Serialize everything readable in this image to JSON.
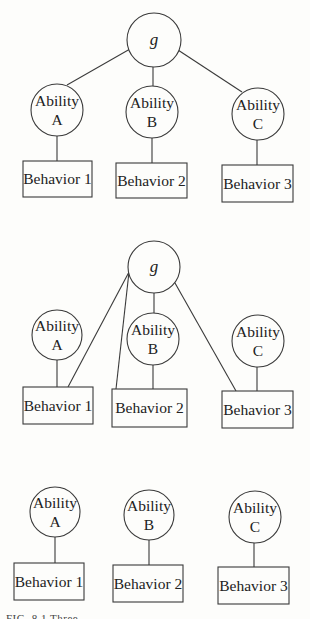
{
  "figure": {
    "caption": "FIG. 8.1   Three",
    "panels": [
      {
        "id": "panel-hierarchical",
        "nodes": [
          {
            "id": "g",
            "type": "circle",
            "label_lines": [
              "g"
            ],
            "italic": true,
            "cx": 154,
            "cy": 40,
            "r": 27
          },
          {
            "id": "ability-a",
            "type": "circle",
            "label_lines": [
              "Ability",
              "A"
            ],
            "cx": 57,
            "cy": 110,
            "r": 26
          },
          {
            "id": "ability-b",
            "type": "circle",
            "label_lines": [
              "Ability",
              "B"
            ],
            "cx": 152,
            "cy": 112,
            "r": 26
          },
          {
            "id": "ability-c",
            "type": "circle",
            "label_lines": [
              "Ability",
              "C"
            ],
            "cx": 258,
            "cy": 114,
            "r": 26
          },
          {
            "id": "behavior-1",
            "type": "box",
            "label_lines": [
              "Behavior 1"
            ],
            "x": 23,
            "y": 161,
            "w": 69,
            "h": 36
          },
          {
            "id": "behavior-2",
            "type": "box",
            "label_lines": [
              "Behavior 2"
            ],
            "x": 116,
            "y": 163,
            "w": 71,
            "h": 35
          },
          {
            "id": "behavior-3",
            "type": "box",
            "label_lines": [
              "Behavior 3"
            ],
            "x": 222,
            "y": 165,
            "w": 71,
            "h": 37
          }
        ],
        "edges": [
          {
            "x1": 130,
            "y1": 49,
            "x2": 67,
            "y2": 85
          },
          {
            "x1": 153,
            "y1": 67,
            "x2": 153,
            "y2": 86
          },
          {
            "x1": 178,
            "y1": 50,
            "x2": 242,
            "y2": 92
          },
          {
            "x1": 57,
            "y1": 136,
            "x2": 57,
            "y2": 161
          },
          {
            "x1": 152,
            "y1": 138,
            "x2": 152,
            "y2": 163
          },
          {
            "x1": 257,
            "y1": 140,
            "x2": 257,
            "y2": 165
          }
        ]
      },
      {
        "id": "panel-direct-g",
        "nodes": [
          {
            "id": "g",
            "type": "circle",
            "label_lines": [
              "g"
            ],
            "italic": true,
            "cx": 154,
            "cy": 267,
            "r": 26
          },
          {
            "id": "ability-a",
            "type": "circle",
            "label_lines": [
              "Ability",
              "A"
            ],
            "cx": 57,
            "cy": 335,
            "r": 25
          },
          {
            "id": "ability-b",
            "type": "circle",
            "label_lines": [
              "Ability",
              "B"
            ],
            "cx": 153,
            "cy": 339,
            "r": 26
          },
          {
            "id": "ability-c",
            "type": "circle",
            "label_lines": [
              "Ability",
              "C"
            ],
            "cx": 258,
            "cy": 341,
            "r": 26
          },
          {
            "id": "behavior-1",
            "type": "box",
            "label_lines": [
              "Behavior 1"
            ],
            "x": 23,
            "y": 387,
            "w": 70,
            "h": 37
          },
          {
            "id": "behavior-2",
            "type": "box",
            "label_lines": [
              "Behavior 2"
            ],
            "x": 112,
            "y": 389,
            "w": 75,
            "h": 38
          },
          {
            "id": "behavior-3",
            "type": "box",
            "label_lines": [
              "Behavior 3"
            ],
            "x": 222,
            "y": 391,
            "w": 71,
            "h": 37
          }
        ],
        "edges": [
          {
            "x1": 129,
            "y1": 272,
            "x2": 68,
            "y2": 387
          },
          {
            "x1": 129,
            "y1": 272,
            "x2": 116,
            "y2": 389
          },
          {
            "x1": 154,
            "y1": 293,
            "x2": 154,
            "y2": 313
          },
          {
            "x1": 175,
            "y1": 283,
            "x2": 236,
            "y2": 391
          },
          {
            "x1": 57,
            "y1": 360,
            "x2": 57,
            "y2": 387
          },
          {
            "x1": 153,
            "y1": 365,
            "x2": 153,
            "y2": 389
          },
          {
            "x1": 257,
            "y1": 367,
            "x2": 257,
            "y2": 391
          }
        ]
      },
      {
        "id": "panel-independent",
        "nodes": [
          {
            "id": "ability-a",
            "type": "circle",
            "label_lines": [
              "Ability",
              "A"
            ],
            "cx": 55,
            "cy": 512,
            "r": 25
          },
          {
            "id": "ability-b",
            "type": "circle",
            "label_lines": [
              "Ability",
              "B"
            ],
            "cx": 149,
            "cy": 515,
            "r": 25
          },
          {
            "id": "ability-c",
            "type": "circle",
            "label_lines": [
              "Ability",
              "C"
            ],
            "cx": 255,
            "cy": 517,
            "r": 26
          },
          {
            "id": "behavior-1",
            "type": "box",
            "label_lines": [
              "Behavior 1"
            ],
            "x": 14,
            "y": 563,
            "w": 70,
            "h": 37
          },
          {
            "id": "behavior-2",
            "type": "box",
            "label_lines": [
              "Behavior 2"
            ],
            "x": 113,
            "y": 565,
            "w": 70,
            "h": 37
          },
          {
            "id": "behavior-3",
            "type": "box",
            "label_lines": [
              "Behavior 3"
            ],
            "x": 218,
            "y": 567,
            "w": 71,
            "h": 37
          }
        ],
        "edges": [
          {
            "x1": 55,
            "y1": 537,
            "x2": 55,
            "y2": 563
          },
          {
            "x1": 149,
            "y1": 540,
            "x2": 149,
            "y2": 565
          },
          {
            "x1": 254,
            "y1": 543,
            "x2": 254,
            "y2": 567
          }
        ]
      }
    ]
  }
}
